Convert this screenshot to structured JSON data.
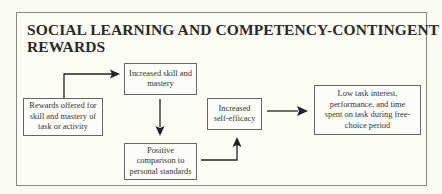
{
  "diagram": {
    "title": "SOCIAL LEARNING AND COMPETENCY-CONTINGENT REWARDS",
    "nodes": [
      {
        "id": "rewards",
        "label": "Rewards offered for skill and mastery of task or activity"
      },
      {
        "id": "skill",
        "label": "Increased skill and mastery"
      },
      {
        "id": "comparison",
        "label": "Positive comparison to personal standards"
      },
      {
        "id": "efficacy",
        "label": "Increased self-efficacy"
      },
      {
        "id": "outcome",
        "label": "Low task interest, performance, and time spent on task during free-choice period"
      }
    ],
    "edges": [
      {
        "from": "rewards",
        "to": "skill"
      },
      {
        "from": "skill",
        "to": "comparison"
      },
      {
        "from": "comparison",
        "to": "efficacy"
      },
      {
        "from": "efficacy",
        "to": "outcome"
      }
    ]
  }
}
